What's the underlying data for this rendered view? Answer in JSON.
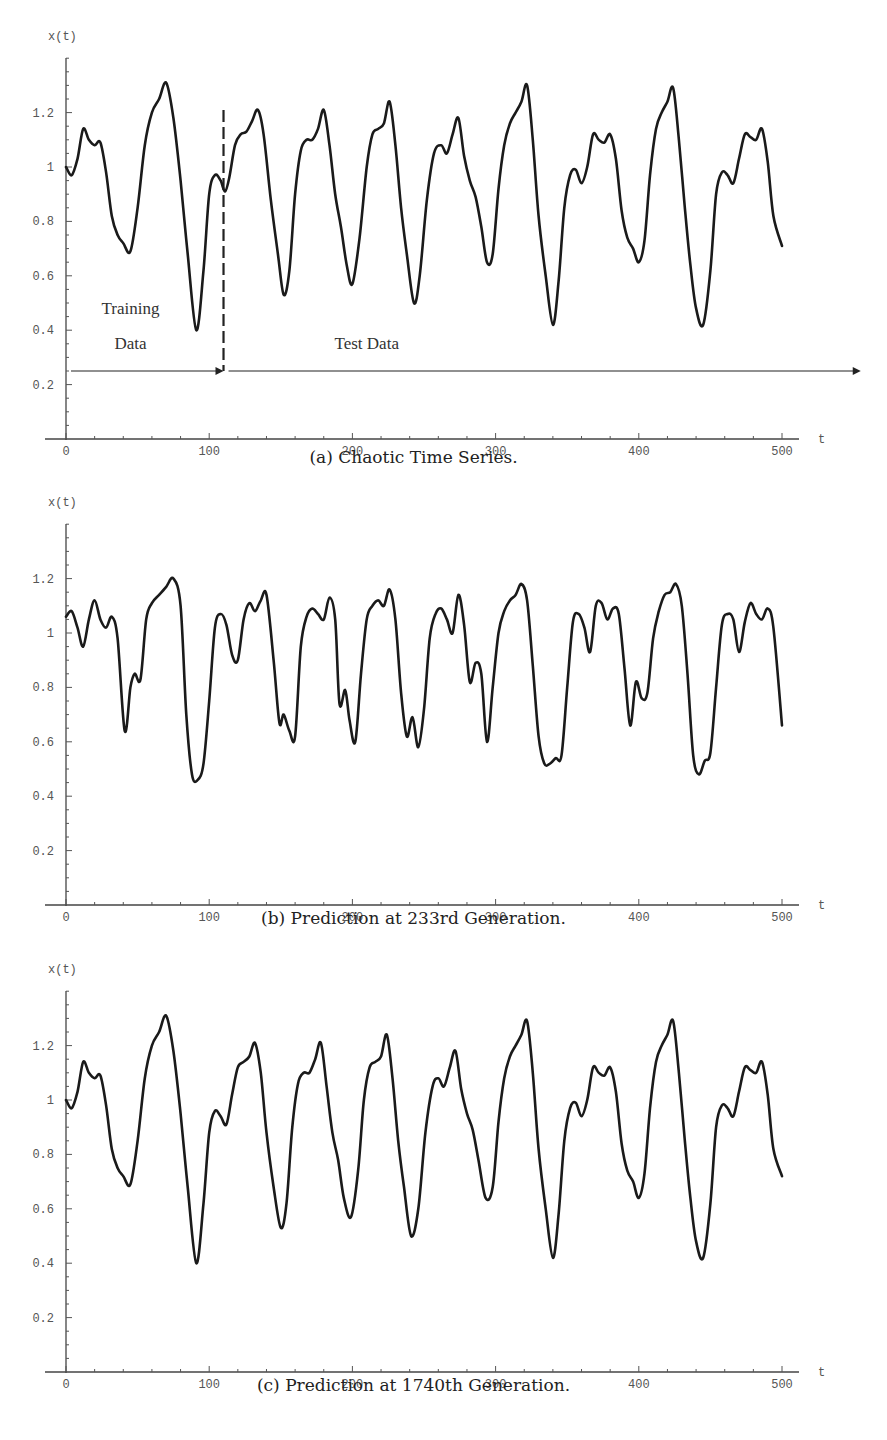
{
  "figure": {
    "panels": [
      {
        "id": "a",
        "caption": "(a) Chaotic Time Series."
      },
      {
        "id": "b",
        "caption": "(b) Prediction at 233rd Generation."
      },
      {
        "id": "c",
        "caption": "(c) Prediction at 1740th Generation."
      }
    ]
  },
  "chart_data": [
    {
      "type": "line",
      "title": "(a) Chaotic Time Series.",
      "xlabel": "t",
      "ylabel": "x(t)",
      "xlim": [
        0,
        500
      ],
      "ylim": [
        0,
        1.4
      ],
      "xticks": [
        0,
        100,
        200,
        300,
        400,
        500
      ],
      "yticks": [
        0.2,
        0.4,
        0.6,
        0.8,
        1,
        1.2
      ],
      "ytick_labels": [
        "0.2",
        "0.4",
        "0.6",
        "0.8",
        "1",
        "1.2"
      ],
      "grid": false,
      "annotations": [
        {
          "text": "Training",
          "x": 45,
          "y": 0.46
        },
        {
          "text": "Data",
          "x": 45,
          "y": 0.33
        },
        {
          "text": "Test Data",
          "x": 210,
          "y": 0.33
        },
        {
          "type": "vline-dashed",
          "x": 110,
          "y0": 0.25,
          "y1": 1.21
        },
        {
          "type": "arrow",
          "x0": 0,
          "x1": 110,
          "y": 0.25,
          "label": "Training Data"
        },
        {
          "type": "arrow",
          "x0": 110,
          "x1": 555,
          "y": 0.25,
          "label": "Test Data"
        }
      ],
      "series": [
        {
          "name": "x(t)",
          "x": [
            0,
            4,
            8,
            12,
            16,
            20,
            24,
            28,
            32,
            36,
            40,
            45,
            50,
            55,
            60,
            65,
            70,
            75,
            80,
            85,
            91,
            96,
            100,
            104,
            108,
            111,
            114,
            118,
            122,
            126,
            130,
            134,
            138,
            143,
            148,
            152,
            156,
            160,
            164,
            168,
            172,
            176,
            180,
            184,
            188,
            192,
            196,
            200,
            205,
            210,
            214,
            218,
            222,
            226,
            230,
            234,
            238,
            243,
            247,
            252,
            257,
            262,
            266,
            270,
            274,
            278,
            282,
            286,
            290,
            294,
            298,
            302,
            306,
            310,
            314,
            318,
            322,
            326,
            330,
            335,
            340,
            344,
            348,
            352,
            356,
            360,
            364,
            368,
            372,
            376,
            380,
            384,
            388,
            392,
            396,
            400,
            404,
            408,
            412,
            416,
            420,
            424,
            428,
            432,
            436,
            440,
            445,
            450,
            454,
            458,
            462,
            466,
            470,
            474,
            478,
            482,
            486,
            490,
            494,
            500
          ],
          "y": [
            1.0,
            0.97,
            1.03,
            1.14,
            1.1,
            1.08,
            1.09,
            0.98,
            0.82,
            0.75,
            0.72,
            0.69,
            0.85,
            1.08,
            1.2,
            1.25,
            1.31,
            1.18,
            0.95,
            0.68,
            0.4,
            0.62,
            0.9,
            0.97,
            0.95,
            0.91,
            0.96,
            1.08,
            1.12,
            1.13,
            1.17,
            1.21,
            1.12,
            0.88,
            0.68,
            0.53,
            0.62,
            0.9,
            1.06,
            1.1,
            1.1,
            1.14,
            1.21,
            1.08,
            0.9,
            0.78,
            0.64,
            0.57,
            0.74,
            1.0,
            1.12,
            1.14,
            1.16,
            1.24,
            1.08,
            0.85,
            0.68,
            0.5,
            0.6,
            0.88,
            1.05,
            1.08,
            1.05,
            1.12,
            1.18,
            1.04,
            0.95,
            0.89,
            0.78,
            0.65,
            0.68,
            0.92,
            1.08,
            1.16,
            1.2,
            1.24,
            1.3,
            1.1,
            0.82,
            0.6,
            0.42,
            0.58,
            0.85,
            0.97,
            0.99,
            0.94,
            1.0,
            1.12,
            1.1,
            1.09,
            1.12,
            1.03,
            0.84,
            0.74,
            0.7,
            0.65,
            0.73,
            0.98,
            1.14,
            1.2,
            1.24,
            1.29,
            1.1,
            0.86,
            0.64,
            0.48,
            0.42,
            0.62,
            0.9,
            0.98,
            0.97,
            0.94,
            1.03,
            1.12,
            1.11,
            1.1,
            1.14,
            1.02,
            0.82,
            0.71
          ]
        }
      ]
    },
    {
      "type": "line",
      "title": "(b) Prediction at 233rd Generation.",
      "xlabel": "t",
      "ylabel": "x(t)",
      "xlim": [
        0,
        500
      ],
      "ylim": [
        0,
        1.4
      ],
      "xticks": [
        0,
        100,
        200,
        300,
        400,
        500
      ],
      "yticks": [
        0.2,
        0.4,
        0.6,
        0.8,
        1,
        1.2
      ],
      "ytick_labels": [
        "0.2",
        "0.4",
        "0.6",
        "0.8",
        "1",
        "1.2"
      ],
      "grid": false,
      "annotations": [],
      "series": [
        {
          "name": "predicted x(t)",
          "x": [
            0,
            4,
            8,
            12,
            16,
            20,
            24,
            28,
            32,
            36,
            41,
            45,
            48,
            52,
            56,
            60,
            65,
            70,
            75,
            80,
            84,
            88,
            92,
            96,
            100,
            104,
            108,
            112,
            116,
            120,
            124,
            128,
            132,
            136,
            140,
            145,
            149,
            152,
            156,
            160,
            164,
            168,
            172,
            176,
            180,
            184,
            188,
            191,
            195,
            198,
            202,
            206,
            210,
            214,
            218,
            222,
            226,
            230,
            234,
            238,
            242,
            246,
            250,
            254,
            258,
            262,
            266,
            270,
            274,
            278,
            282,
            286,
            290,
            294,
            298,
            302,
            306,
            310,
            314,
            318,
            322,
            326,
            330,
            334,
            338,
            342,
            346,
            350,
            354,
            358,
            362,
            366,
            370,
            374,
            378,
            382,
            386,
            390,
            394,
            398,
            402,
            406,
            410,
            414,
            418,
            422,
            426,
            430,
            434,
            438,
            442,
            446,
            450,
            454,
            458,
            462,
            466,
            470,
            474,
            478,
            482,
            486,
            490,
            494,
            500
          ],
          "y": [
            1.06,
            1.08,
            1.02,
            0.95,
            1.05,
            1.12,
            1.05,
            1.02,
            1.06,
            0.98,
            0.64,
            0.8,
            0.85,
            0.83,
            1.05,
            1.11,
            1.14,
            1.17,
            1.2,
            1.1,
            0.7,
            0.48,
            0.46,
            0.52,
            0.75,
            1.02,
            1.07,
            1.03,
            0.92,
            0.9,
            1.05,
            1.11,
            1.08,
            1.12,
            1.14,
            0.9,
            0.67,
            0.7,
            0.64,
            0.62,
            0.95,
            1.06,
            1.09,
            1.07,
            1.05,
            1.13,
            1.05,
            0.74,
            0.79,
            0.68,
            0.6,
            0.85,
            1.05,
            1.1,
            1.12,
            1.1,
            1.16,
            1.05,
            0.78,
            0.62,
            0.69,
            0.58,
            0.72,
            0.98,
            1.07,
            1.09,
            1.05,
            1.0,
            1.14,
            1.03,
            0.82,
            0.89,
            0.85,
            0.6,
            0.8,
            1.0,
            1.08,
            1.12,
            1.14,
            1.18,
            1.12,
            0.88,
            0.62,
            0.52,
            0.52,
            0.54,
            0.55,
            0.8,
            1.04,
            1.07,
            1.02,
            0.93,
            1.1,
            1.11,
            1.05,
            1.09,
            1.07,
            0.87,
            0.66,
            0.82,
            0.76,
            0.78,
            0.98,
            1.08,
            1.14,
            1.15,
            1.18,
            1.1,
            0.85,
            0.55,
            0.48,
            0.53,
            0.56,
            0.8,
            1.03,
            1.07,
            1.05,
            0.93,
            1.04,
            1.11,
            1.07,
            1.05,
            1.09,
            1.02,
            0.66
          ]
        }
      ]
    },
    {
      "type": "line",
      "title": "(c) Prediction at 1740th Generation.",
      "xlabel": "t",
      "ylabel": "x(t)",
      "xlim": [
        0,
        500
      ],
      "ylim": [
        0,
        1.4
      ],
      "xticks": [
        0,
        100,
        200,
        300,
        400,
        500
      ],
      "yticks": [
        0.2,
        0.4,
        0.6,
        0.8,
        1,
        1.2
      ],
      "ytick_labels": [
        "0.2",
        "0.4",
        "0.6",
        "0.8",
        "1",
        "1.2"
      ],
      "grid": false,
      "annotations": [],
      "series": [
        {
          "name": "predicted x(t)",
          "x": [
            0,
            4,
            8,
            12,
            16,
            20,
            24,
            28,
            32,
            36,
            40,
            45,
            50,
            55,
            60,
            65,
            70,
            75,
            80,
            85,
            91,
            96,
            100,
            104,
            108,
            112,
            116,
            120,
            124,
            128,
            132,
            136,
            140,
            145,
            150,
            154,
            158,
            162,
            166,
            170,
            174,
            178,
            182,
            186,
            190,
            194,
            199,
            204,
            208,
            212,
            216,
            220,
            224,
            228,
            232,
            236,
            241,
            246,
            251,
            256,
            260,
            264,
            268,
            272,
            276,
            280,
            284,
            288,
            293,
            298,
            302,
            306,
            310,
            314,
            318,
            322,
            326,
            330,
            335,
            340,
            344,
            348,
            352,
            356,
            360,
            364,
            368,
            372,
            376,
            380,
            384,
            388,
            392,
            396,
            400,
            404,
            408,
            412,
            416,
            420,
            424,
            428,
            432,
            436,
            440,
            445,
            450,
            454,
            458,
            462,
            466,
            470,
            474,
            478,
            482,
            486,
            490,
            494,
            500
          ],
          "y": [
            1.0,
            0.97,
            1.03,
            1.14,
            1.1,
            1.08,
            1.09,
            0.98,
            0.82,
            0.75,
            0.72,
            0.69,
            0.85,
            1.08,
            1.2,
            1.25,
            1.31,
            1.18,
            0.95,
            0.68,
            0.4,
            0.62,
            0.88,
            0.96,
            0.94,
            0.91,
            1.02,
            1.12,
            1.14,
            1.16,
            1.21,
            1.1,
            0.88,
            0.68,
            0.53,
            0.62,
            0.9,
            1.06,
            1.1,
            1.1,
            1.15,
            1.21,
            1.05,
            0.88,
            0.78,
            0.64,
            0.57,
            0.74,
            1.0,
            1.12,
            1.14,
            1.16,
            1.24,
            1.08,
            0.85,
            0.68,
            0.5,
            0.6,
            0.88,
            1.05,
            1.08,
            1.05,
            1.12,
            1.18,
            1.04,
            0.95,
            0.89,
            0.78,
            0.64,
            0.68,
            0.92,
            1.08,
            1.16,
            1.2,
            1.24,
            1.29,
            1.1,
            0.82,
            0.6,
            0.42,
            0.58,
            0.85,
            0.97,
            0.99,
            0.94,
            1.0,
            1.12,
            1.1,
            1.09,
            1.12,
            1.03,
            0.84,
            0.74,
            0.7,
            0.64,
            0.73,
            0.98,
            1.14,
            1.2,
            1.24,
            1.29,
            1.1,
            0.86,
            0.64,
            0.48,
            0.42,
            0.62,
            0.9,
            0.98,
            0.97,
            0.94,
            1.03,
            1.12,
            1.11,
            1.1,
            1.14,
            1.02,
            0.82,
            0.72
          ]
        }
      ]
    }
  ]
}
